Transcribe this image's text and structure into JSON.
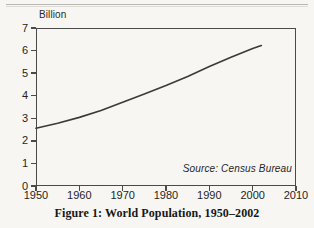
{
  "figure": {
    "caption": "Figure 1: World Population, 1950–2002",
    "source_note": "Source: Census Bureau",
    "unit_label": "Billion"
  },
  "colors": {
    "paper": "#f7f6f2",
    "frame": "#4a4a4a",
    "line": "#3a3a3a",
    "text": "#1f1f1f"
  },
  "chart_data": {
    "type": "line",
    "title": "Figure 1: World Population, 1950–2002",
    "xlabel": "",
    "ylabel": "Billion",
    "xlim": [
      1950,
      2010
    ],
    "ylim": [
      0,
      7
    ],
    "grid": false,
    "legend": null,
    "annotations": [
      {
        "text": "Source: Census Bureau",
        "position": "inside-bottom-right"
      }
    ],
    "xticks": [
      1950,
      1960,
      1970,
      1980,
      1990,
      2000,
      2010
    ],
    "xtick_labels": [
      "1950",
      "1960",
      "1970",
      "1980",
      "1990",
      "2000",
      "2010"
    ],
    "yticks": [
      0,
      1,
      2,
      3,
      4,
      5,
      6,
      7
    ],
    "ytick_labels": [
      "0",
      "1",
      "2",
      "3",
      "4",
      "5",
      "6",
      "7"
    ],
    "series": [
      {
        "name": "World Population",
        "x": [
          1950,
          1955,
          1960,
          1965,
          1970,
          1975,
          1980,
          1985,
          1990,
          1995,
          2000,
          2002
        ],
        "values": [
          2.56,
          2.78,
          3.04,
          3.35,
          3.71,
          4.08,
          4.45,
          4.85,
          5.29,
          5.7,
          6.09,
          6.22
        ]
      }
    ]
  }
}
